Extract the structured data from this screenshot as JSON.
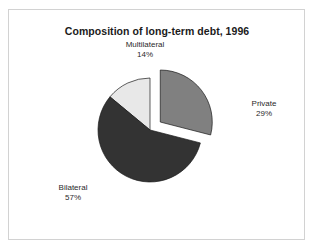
{
  "figure": {
    "title": "Composition of long-term debt, 1996",
    "background": "#ffffff",
    "frame_color": "#d2d2d2"
  },
  "chart_data": {
    "type": "pie",
    "title": "Composition of long-term debt, 1996",
    "xlabel": "",
    "ylabel": "",
    "legend_position": "none",
    "grid": false,
    "unit": "percent",
    "categories": [
      "Multilateral",
      "Private",
      "Bilateral"
    ],
    "values": [
      14,
      29,
      57
    ],
    "value_labels": [
      "14%",
      "29%",
      "57%"
    ],
    "colors": [
      "#e8e8e8",
      "#808080",
      "#333333"
    ],
    "exploded": [
      false,
      true,
      false
    ],
    "slices": [
      {
        "name": "Multilateral",
        "value": 14,
        "value_label": "14%",
        "color": "#e8e8e8",
        "exploded": false,
        "start_angle_deg": 309.6,
        "end_angle_deg": 360.0
      },
      {
        "name": "Private",
        "value": 29,
        "value_label": "29%",
        "color": "#808080",
        "exploded": true,
        "start_angle_deg": 0.0,
        "end_angle_deg": 104.4
      },
      {
        "name": "Bilateral",
        "value": 57,
        "value_label": "57%",
        "color": "#333333",
        "exploded": false,
        "start_angle_deg": 104.4,
        "end_angle_deg": 309.6
      }
    ]
  },
  "labels": {
    "multilateral": {
      "name": "Multilateral",
      "value": "14%"
    },
    "private": {
      "name": "Private",
      "value": "29%"
    },
    "bilateral": {
      "name": "Bilateral",
      "value": "57%"
    }
  }
}
